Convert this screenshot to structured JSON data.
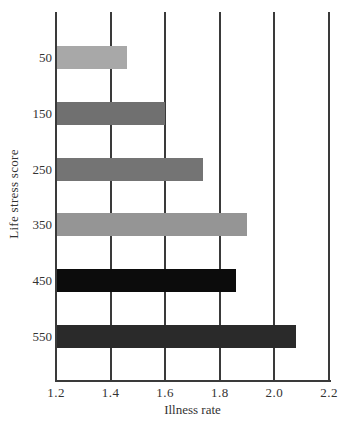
{
  "chart_data": {
    "type": "bar",
    "orientation": "horizontal",
    "title": "",
    "xlabel": "Illness rate",
    "ylabel": "Life stress score",
    "categories": [
      "50",
      "150",
      "250",
      "350",
      "450",
      "550"
    ],
    "values": [
      1.46,
      1.6,
      1.74,
      1.9,
      1.86,
      2.08
    ],
    "colors": [
      "#a8a8a8",
      "#707070",
      "#747474",
      "#959595",
      "#0c0c0c",
      "#2a2a2a"
    ],
    "xlim": [
      1.2,
      2.2
    ],
    "xticks": [
      "1.2",
      "1.4",
      "1.6",
      "1.8",
      "2.0",
      "2.2"
    ],
    "grid": "vertical",
    "legend": null
  }
}
